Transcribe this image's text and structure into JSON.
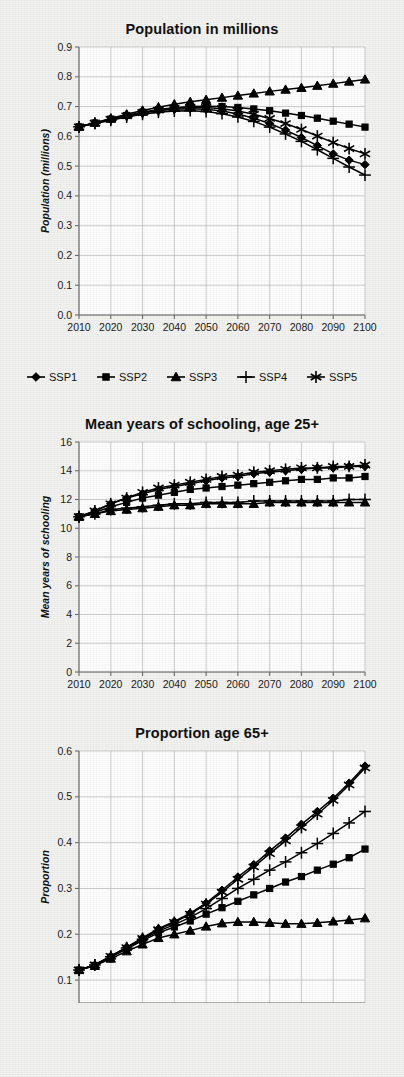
{
  "figure": {
    "background_color": "#f3f3f1",
    "plot_background_color": "#ffffff",
    "line_color": "#000000",
    "grid_color": "#b9b9b9"
  },
  "legend": {
    "position": "below-first-chart",
    "entries": [
      {
        "label": "SSP1",
        "marker": "diamond"
      },
      {
        "label": "SSP2",
        "marker": "square"
      },
      {
        "label": "SSP3",
        "marker": "triangle"
      },
      {
        "label": "SSP4",
        "marker": "plus"
      },
      {
        "label": "SSP5",
        "marker": "asterisk"
      }
    ]
  },
  "chart_data": [
    {
      "id": "population",
      "type": "line",
      "title": "Population in millions",
      "xlabel": "",
      "ylabel": "Population (millions)",
      "x": [
        2010,
        2015,
        2020,
        2025,
        2030,
        2035,
        2040,
        2045,
        2050,
        2055,
        2060,
        2065,
        2070,
        2075,
        2080,
        2085,
        2090,
        2095,
        2100
      ],
      "xlim": [
        2010,
        2100
      ],
      "ylim": [
        0.0,
        0.9
      ],
      "yticks": [
        "0.0",
        "0.1",
        "0.2",
        "0.3",
        "0.4",
        "0.5",
        "0.6",
        "0.7",
        "0.8",
        "0.9"
      ],
      "xticks": [
        "2010",
        "2020",
        "2030",
        "2040",
        "2050",
        "2060",
        "2070",
        "2080",
        "2090",
        "2100"
      ],
      "grid": true,
      "series": [
        {
          "name": "SSP1",
          "marker": "diamond",
          "values": [
            0.632,
            0.644,
            0.656,
            0.668,
            0.678,
            0.686,
            0.691,
            0.693,
            0.691,
            0.685,
            0.675,
            0.661,
            0.643,
            0.621,
            0.596,
            0.569,
            0.541,
            0.52,
            0.505
          ]
        },
        {
          "name": "SSP2",
          "marker": "square",
          "values": [
            0.632,
            0.645,
            0.658,
            0.67,
            0.681,
            0.69,
            0.696,
            0.7,
            0.701,
            0.7,
            0.697,
            0.692,
            0.686,
            0.678,
            0.67,
            0.661,
            0.651,
            0.641,
            0.631
          ]
        },
        {
          "name": "SSP3",
          "marker": "triangle",
          "values": [
            0.632,
            0.646,
            0.66,
            0.674,
            0.687,
            0.698,
            0.708,
            0.716,
            0.723,
            0.73,
            0.737,
            0.744,
            0.751,
            0.757,
            0.763,
            0.77,
            0.777,
            0.784,
            0.791
          ]
        },
        {
          "name": "SSP4",
          "marker": "plus",
          "values": [
            0.632,
            0.643,
            0.654,
            0.665,
            0.674,
            0.681,
            0.685,
            0.686,
            0.683,
            0.676,
            0.665,
            0.65,
            0.631,
            0.608,
            0.583,
            0.555,
            0.526,
            0.497,
            0.47
          ]
        },
        {
          "name": "SSP5",
          "marker": "asterisk",
          "values": [
            0.632,
            0.644,
            0.657,
            0.669,
            0.68,
            0.688,
            0.694,
            0.697,
            0.697,
            0.693,
            0.685,
            0.674,
            0.66,
            0.643,
            0.623,
            0.601,
            0.579,
            0.559,
            0.541
          ]
        }
      ]
    },
    {
      "id": "schooling",
      "type": "line",
      "title": "Mean years of schooling, age 25+",
      "xlabel": "",
      "ylabel": "Mean years of schooling",
      "x": [
        2010,
        2015,
        2020,
        2025,
        2030,
        2035,
        2040,
        2045,
        2050,
        2055,
        2060,
        2065,
        2070,
        2075,
        2080,
        2085,
        2090,
        2095,
        2100
      ],
      "xlim": [
        2010,
        2100
      ],
      "ylim": [
        0,
        16
      ],
      "yticks": [
        "0",
        "2",
        "4",
        "6",
        "8",
        "10",
        "12",
        "14",
        "16"
      ],
      "xticks": [
        "2010",
        "2020",
        "2030",
        "2040",
        "2050",
        "2060",
        "2070",
        "2080",
        "2090",
        "2100"
      ],
      "grid": true,
      "series": [
        {
          "name": "SSP1",
          "marker": "diamond",
          "values": [
            10.8,
            11.2,
            11.7,
            12.1,
            12.4,
            12.7,
            12.9,
            13.1,
            13.3,
            13.5,
            13.6,
            13.8,
            13.9,
            14.0,
            14.1,
            14.2,
            14.2,
            14.3,
            14.3
          ]
        },
        {
          "name": "SSP2",
          "marker": "square",
          "values": [
            10.8,
            11.1,
            11.5,
            11.8,
            12.1,
            12.3,
            12.5,
            12.7,
            12.8,
            12.9,
            13.0,
            13.1,
            13.2,
            13.3,
            13.4,
            13.4,
            13.5,
            13.5,
            13.6
          ]
        },
        {
          "name": "SSP3",
          "marker": "triangle",
          "values": [
            10.8,
            11.0,
            11.2,
            11.3,
            11.4,
            11.5,
            11.6,
            11.6,
            11.7,
            11.7,
            11.7,
            11.7,
            11.8,
            11.8,
            11.8,
            11.8,
            11.8,
            11.8,
            11.8
          ]
        },
        {
          "name": "SSP4",
          "marker": "plus",
          "values": [
            10.8,
            11.0,
            11.3,
            11.4,
            11.5,
            11.6,
            11.7,
            11.7,
            11.8,
            11.8,
            11.8,
            11.9,
            11.9,
            11.9,
            11.9,
            11.9,
            11.9,
            12.0,
            12.0
          ]
        },
        {
          "name": "SSP5",
          "marker": "asterisk",
          "values": [
            10.8,
            11.2,
            11.7,
            12.1,
            12.5,
            12.8,
            13.0,
            13.2,
            13.4,
            13.6,
            13.7,
            13.9,
            14.0,
            14.1,
            14.2,
            14.2,
            14.3,
            14.3,
            14.4
          ]
        }
      ]
    },
    {
      "id": "proportion65",
      "type": "line",
      "title": "Proportion age 65+",
      "xlabel": "",
      "ylabel": "Proportion",
      "x": [
        2010,
        2015,
        2020,
        2025,
        2030,
        2035,
        2040,
        2045,
        2050,
        2055,
        2060,
        2065,
        2070,
        2075,
        2080,
        2085,
        2090,
        2095,
        2100
      ],
      "xlim": [
        2010,
        2100
      ],
      "ylim": [
        0.05,
        0.6
      ],
      "yticks": [
        "0.1",
        "0.2",
        "0.3",
        "0.4",
        "0.5",
        "0.6"
      ],
      "xticks": [
        "2010",
        "2020",
        "2030",
        "2040",
        "2050",
        "2060",
        "2070",
        "2080",
        "2090",
        "2100"
      ],
      "grid": true,
      "clipped_bottom": true,
      "series": [
        {
          "name": "SSP1",
          "marker": "diamond",
          "values": [
            0.122,
            0.133,
            0.152,
            0.172,
            0.192,
            0.212,
            0.228,
            0.246,
            0.268,
            0.296,
            0.325,
            0.352,
            0.382,
            0.41,
            0.44,
            0.468,
            0.497,
            0.53,
            0.567
          ]
        },
        {
          "name": "SSP2",
          "marker": "square",
          "values": [
            0.122,
            0.132,
            0.15,
            0.168,
            0.186,
            0.203,
            0.216,
            0.229,
            0.244,
            0.258,
            0.272,
            0.286,
            0.3,
            0.314,
            0.326,
            0.34,
            0.353,
            0.367,
            0.386
          ]
        },
        {
          "name": "SSP3",
          "marker": "triangle",
          "values": [
            0.122,
            0.131,
            0.147,
            0.163,
            0.178,
            0.192,
            0.2,
            0.208,
            0.217,
            0.224,
            0.227,
            0.227,
            0.225,
            0.223,
            0.223,
            0.225,
            0.228,
            0.231,
            0.235
          ]
        },
        {
          "name": "SSP4",
          "marker": "plus",
          "values": [
            0.122,
            0.133,
            0.151,
            0.17,
            0.189,
            0.207,
            0.221,
            0.237,
            0.256,
            0.278,
            0.3,
            0.32,
            0.34,
            0.358,
            0.378,
            0.398,
            0.42,
            0.443,
            0.468
          ]
        },
        {
          "name": "SSP5",
          "marker": "asterisk",
          "values": [
            0.122,
            0.133,
            0.152,
            0.171,
            0.191,
            0.21,
            0.226,
            0.244,
            0.266,
            0.292,
            0.32,
            0.347,
            0.376,
            0.404,
            0.433,
            0.462,
            0.492,
            0.526,
            0.563
          ]
        }
      ]
    }
  ]
}
